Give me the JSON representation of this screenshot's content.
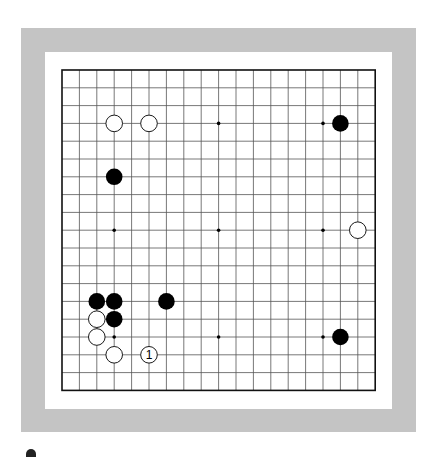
{
  "board": {
    "size": 19,
    "origin": {
      "x": 62,
      "y": 70
    },
    "spacing": {
      "x": 17.4,
      "y": 17.8
    },
    "line_color": "#555555",
    "border_color": "#111111",
    "hoshi": [
      [
        3,
        3
      ],
      [
        9,
        3
      ],
      [
        15,
        3
      ],
      [
        3,
        9
      ],
      [
        9,
        9
      ],
      [
        15,
        9
      ],
      [
        3,
        15
      ],
      [
        9,
        15
      ],
      [
        15,
        15
      ]
    ],
    "stones": [
      {
        "color": "white",
        "col": 3,
        "row": 3
      },
      {
        "color": "white",
        "col": 5,
        "row": 3
      },
      {
        "color": "black",
        "col": 16,
        "row": 3
      },
      {
        "color": "black",
        "col": 3,
        "row": 6
      },
      {
        "color": "white",
        "col": 17,
        "row": 9
      },
      {
        "color": "black",
        "col": 2,
        "row": 13
      },
      {
        "color": "black",
        "col": 3,
        "row": 13
      },
      {
        "color": "black",
        "col": 6,
        "row": 13
      },
      {
        "color": "white",
        "col": 2,
        "row": 14
      },
      {
        "color": "black",
        "col": 3,
        "row": 14
      },
      {
        "color": "white",
        "col": 2,
        "row": 15
      },
      {
        "color": "black",
        "col": 16,
        "row": 15
      },
      {
        "color": "white",
        "col": 3,
        "row": 16
      },
      {
        "color": "white",
        "col": 5,
        "row": 16,
        "label": "1"
      }
    ]
  },
  "colors": {
    "frame": "#c4c4c4",
    "panel": "#ffffff",
    "black_stone": "#000000",
    "white_stone": "#ffffff"
  }
}
